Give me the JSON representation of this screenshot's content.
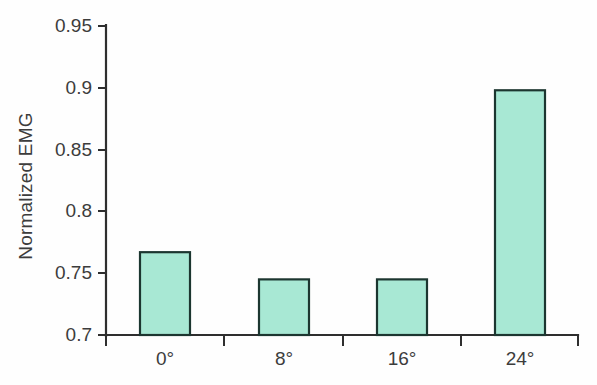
{
  "chart_data": {
    "type": "bar",
    "title": "",
    "xlabel": "",
    "ylabel": "Normalized EMG",
    "categories": [
      "0°",
      "8°",
      "16°",
      "24°"
    ],
    "values": [
      0.767,
      0.745,
      0.745,
      0.898
    ],
    "ylim": [
      0.7,
      0.95
    ],
    "ytick_labels": [
      "0.95",
      "0.9",
      "0.85",
      "0.8",
      "0.75",
      "0.7"
    ],
    "ytick_values": [
      0.95,
      0.9,
      0.85,
      0.8,
      0.75,
      0.7
    ],
    "grid": false,
    "legend": "none",
    "series": [
      {
        "name": "Normalized EMG",
        "values": [
          0.767,
          0.745,
          0.745,
          0.898
        ]
      }
    ]
  },
  "style": {
    "bar_fill": "#a8e8d4",
    "bar_stroke": "#1c3630",
    "axis_color": "#2e2e2e",
    "text_color": "#3c3c3c",
    "background": "#fefefe"
  },
  "geometry": {
    "plot_left": 106,
    "plot_right": 578,
    "baseline_y": 335,
    "top_y": 26,
    "bar_width": 50,
    "category_centers": [
      165,
      284,
      402,
      520
    ]
  }
}
